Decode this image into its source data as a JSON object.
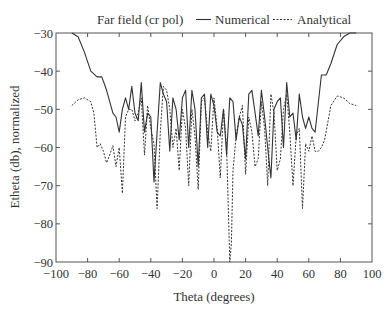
{
  "chart_data": {
    "type": "line",
    "title": "Far field (cr pol)",
    "xlabel": "Theta (degrees)",
    "ylabel": "Etheta (db), normalized",
    "xlim": [
      -100,
      100
    ],
    "ylim": [
      -90,
      -30
    ],
    "xticks": [
      -100,
      -80,
      -60,
      -40,
      -20,
      0,
      20,
      40,
      60,
      80,
      100
    ],
    "yticks": [
      -30,
      -40,
      -50,
      -60,
      -70,
      -80,
      -90
    ],
    "xtick_labels": [
      "−100",
      "−80",
      "−60",
      "−40",
      "−20",
      "0",
      "20",
      "40",
      "60",
      "80",
      "100"
    ],
    "ytick_labels": [
      "−30",
      "−40",
      "−50",
      "−60",
      "−70",
      "−80",
      "−90"
    ],
    "grid": false,
    "legend_position": "top-right, outside plot",
    "series": [
      {
        "name": "Numerical",
        "style": "solid",
        "x": [
          -90,
          -86,
          -82,
          -78,
          -74,
          -71,
          -68,
          -64,
          -62,
          -60,
          -58,
          -56,
          -54,
          -52,
          -50,
          -48,
          -46,
          -44,
          -42,
          -40,
          -38,
          -36,
          -34,
          -32,
          -30,
          -28,
          -26,
          -24,
          -22,
          -20,
          -18,
          -16,
          -14,
          -12,
          -10,
          -8,
          -6,
          -4,
          -2,
          0,
          2,
          4,
          6,
          8,
          10,
          12,
          14,
          16,
          18,
          20,
          22,
          24,
          26,
          28,
          30,
          32,
          34,
          36,
          38,
          40,
          42,
          44,
          46,
          48,
          50,
          52,
          54,
          56,
          58,
          60,
          62,
          64,
          68,
          71,
          74,
          78,
          82,
          86,
          90
        ],
        "y": [
          -30,
          -31,
          -35,
          -40,
          -41.5,
          -41.5,
          -45,
          -51,
          -52,
          -56,
          -50,
          -47,
          -50,
          -44,
          -51,
          -53,
          -43,
          -56,
          -51,
          -52,
          -69,
          -56,
          -43,
          -46,
          -48,
          -61,
          -47,
          -50,
          -58,
          -47,
          -45,
          -60,
          -45,
          -50,
          -65,
          -47,
          -46,
          -60,
          -46,
          -49,
          -56,
          -57,
          -50,
          -62,
          -47,
          -48,
          -58,
          -52,
          -54,
          -63,
          -46,
          -45,
          -51,
          -57,
          -45,
          -52,
          -60,
          -68,
          -50,
          -48,
          -47,
          -60,
          -43,
          -52,
          -51,
          -58,
          -46,
          -52,
          -55,
          -52,
          -55,
          -56,
          -41,
          -41,
          -38,
          -33,
          -31,
          -30,
          -30
        ]
      },
      {
        "name": "Analytical",
        "style": "dotted",
        "x": [
          -90,
          -86,
          -82,
          -78,
          -76,
          -74,
          -72,
          -70,
          -68,
          -66,
          -64,
          -62,
          -60,
          -58,
          -56,
          -54,
          -52,
          -50,
          -48,
          -46,
          -44,
          -42,
          -40,
          -38,
          -36,
          -34,
          -32,
          -30,
          -28,
          -26,
          -24,
          -22,
          -20,
          -18,
          -16,
          -14,
          -12,
          -10,
          -8,
          -6,
          -4,
          -2,
          0,
          2,
          4,
          6,
          8,
          10,
          11,
          12,
          14,
          16,
          18,
          20,
          22,
          24,
          26,
          28,
          30,
          32,
          34,
          36,
          38,
          40,
          42,
          44,
          46,
          48,
          50,
          52,
          54,
          56,
          58,
          60,
          62,
          64,
          66,
          68,
          70,
          74,
          78,
          82,
          86,
          90
        ],
        "y": [
          -49,
          -47.5,
          -47,
          -48,
          -51,
          -60,
          -59,
          -61,
          -64,
          -62,
          -59.5,
          -65,
          -60,
          -72,
          -52,
          -50,
          -50,
          -53,
          -51,
          -47,
          -62,
          -49,
          -55,
          -59,
          -76,
          -56,
          -44,
          -45,
          -50,
          -60,
          -55,
          -66,
          -50,
          -55,
          -70,
          -50,
          -57,
          -71,
          -48,
          -47,
          -56,
          -61,
          -47,
          -55,
          -68,
          -50,
          -60,
          -90,
          -85,
          -66,
          -57,
          -52,
          -49,
          -67,
          -52,
          -56,
          -65,
          -63,
          -48,
          -55,
          -70,
          -46,
          -51,
          -66,
          -63,
          -50,
          -46,
          -56,
          -70,
          -57,
          -55,
          -76,
          -59,
          -61,
          -57,
          -61,
          -61,
          -60,
          -58,
          -49,
          -46.5,
          -47,
          -48.5,
          -49
        ]
      }
    ]
  },
  "title_text": "Far field (cr pol)",
  "legend": {
    "items": [
      {
        "label": "Numerical",
        "style": "solid"
      },
      {
        "label": "Analytical",
        "style": "dotted"
      }
    ]
  },
  "axes": {
    "xlabel": "Theta (degrees)",
    "ylabel": "Etheta (db), normalized"
  }
}
